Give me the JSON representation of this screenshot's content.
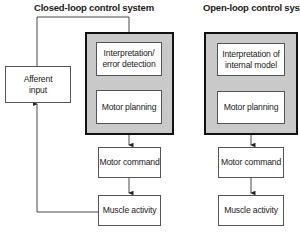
{
  "closed_loop": {
    "title": "Closed-loop control system",
    "boxes": {
      "afferent": "Afferent input",
      "interpretation": "Interpretation/ error detection",
      "planning": "Motor planning",
      "command": "Motor command",
      "muscle": "Muscle activity"
    }
  },
  "open_loop": {
    "title": "Open-loop control system",
    "boxes": {
      "interpretation": "Interpretation of internal model",
      "planning": "Motor planning",
      "command": "Motor command",
      "muscle": "Muscle activity"
    }
  },
  "colors": {
    "frame_fill": "#c9c9c9",
    "frame_border": "#111111",
    "line": "#333333"
  }
}
